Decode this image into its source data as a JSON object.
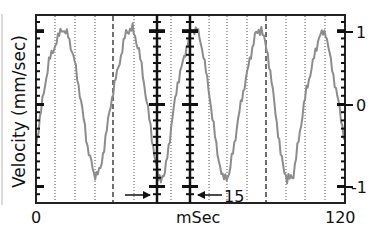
{
  "chart_data": {
    "type": "line",
    "title": "",
    "xlabel": "mSec",
    "ylabel": "Velocity (mm/sec)",
    "xlim": [
      0,
      120
    ],
    "ylim": [
      -1.2,
      1.2
    ],
    "x_tick_labels": [
      "0",
      "120"
    ],
    "y_tick_labels": [
      "1",
      "0",
      "-1"
    ],
    "y_ticks": [
      1,
      0,
      -1
    ],
    "grid": false,
    "annotations": [
      {
        "text": "15",
        "type": "interval-arrows",
        "x_start": 48,
        "x_end": 61,
        "description": "arrows marking interval between two vertical tick axes"
      }
    ],
    "series": [
      {
        "name": "velocity",
        "color": "#8c8c8c",
        "description": "noisy sinusoid, period ~25 ms, amplitude ~1 mm/sec",
        "x": [
          0,
          5,
          10,
          12.5,
          15,
          20,
          22.5,
          25,
          30,
          35,
          37.5,
          40,
          45,
          47.5,
          50,
          55,
          60,
          62.5,
          65,
          70,
          72.5,
          75,
          80,
          85,
          87.5,
          90,
          95,
          97.5,
          100,
          105,
          110,
          112.5,
          115,
          120
        ],
        "values": [
          -0.5,
          0.6,
          1.05,
          0.95,
          0.6,
          -0.5,
          -0.85,
          -0.8,
          0.2,
          1.0,
          1.05,
          0.75,
          -0.4,
          -0.9,
          -0.85,
          0.3,
          1.0,
          1.05,
          0.7,
          -0.5,
          -0.9,
          -0.85,
          0.1,
          0.95,
          1.05,
          0.7,
          -0.6,
          -0.92,
          -0.85,
          0.2,
          0.95,
          1.0,
          0.5,
          -0.45
        ]
      }
    ],
    "reference_lines": {
      "dotted_x_px": [
        55,
        75,
        95,
        134,
        171,
        209,
        227,
        247,
        286,
        305,
        325
      ],
      "dashed_x_px": [
        113,
        266
      ],
      "tick_axes_x_px": [
        157,
        190
      ]
    }
  },
  "labels": {
    "ylabel": "Velocity (mm/sec)",
    "xlabel": "mSec",
    "x0": "0",
    "x120": "120",
    "y1": "1",
    "y0": "0",
    "ym1": "-1",
    "interval": "15"
  }
}
